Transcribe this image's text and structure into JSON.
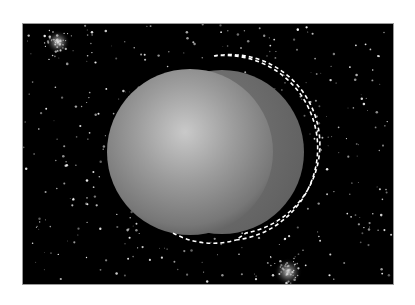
{
  "scene": {
    "description": "Gray shaded sphere on a starfield with a dashed crescent selection outline",
    "background_color": "#000000",
    "page_color": "#ffffff",
    "frame_border_color": "#9a9a9a"
  },
  "sphere": {
    "center": [
      190,
      152
    ],
    "radius": 83,
    "highlight": [
      187,
      128
    ],
    "colors": {
      "highlight": "#c8c8c8",
      "mid": "#8e8e8e",
      "edge": "#5a5a5a"
    }
  },
  "crescent": {
    "center": [
      222,
      152
    ],
    "radius": 82,
    "color": "#6e6e6e"
  },
  "selection": {
    "style": "marching-ants",
    "dash_colors": [
      "#ffffff",
      "#000000"
    ]
  },
  "star_clusters": [
    {
      "center": [
        58,
        42
      ],
      "label": "cluster-top-left"
    },
    {
      "center": [
        288,
        270
      ],
      "label": "cluster-bottom-right"
    }
  ]
}
